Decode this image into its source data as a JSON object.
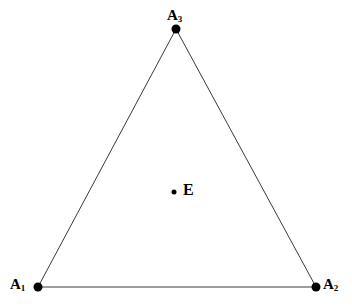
{
  "figure": {
    "background_color": "#ffffff",
    "width": 352,
    "height": 307,
    "stroke_color": "#3a3a3a",
    "marker_color": "#000000",
    "label_color": "#000000"
  },
  "labels": {
    "a1_base": "A",
    "a1_sub": "1",
    "a2_base": "A",
    "a2_sub": "2",
    "a3_base": "A",
    "a3_sub": "3",
    "e": "E"
  },
  "chart_data": {
    "type": "scatter",
    "title": "",
    "subtitle": "",
    "xlabel": "",
    "ylabel": "",
    "grid": false,
    "legend": null,
    "xlim": [
      0,
      352
    ],
    "ylim": [
      307,
      0
    ],
    "annotations": [
      {
        "name": "A3",
        "text": "A3",
        "x": 176,
        "y": 29,
        "position": "above"
      },
      {
        "name": "A1",
        "text": "A1",
        "x": 38,
        "y": 287,
        "position": "left"
      },
      {
        "name": "A2",
        "text": "A2",
        "x": 316,
        "y": 287,
        "position": "right"
      },
      {
        "name": "E",
        "text": "E",
        "x": 174,
        "y": 192,
        "position": "right"
      }
    ],
    "series": [
      {
        "name": "vertices",
        "marker": "filled-circle",
        "marker_size": 9,
        "points": [
          {
            "label": "A3",
            "x": 176,
            "y": 29
          },
          {
            "label": "A1",
            "x": 38,
            "y": 287
          },
          {
            "label": "A2",
            "x": 316,
            "y": 287
          }
        ]
      },
      {
        "name": "interior-point",
        "marker": "filled-circle",
        "marker_size": 5,
        "points": [
          {
            "label": "E",
            "x": 174,
            "y": 192
          }
        ]
      }
    ],
    "shapes": [
      {
        "name": "triangle",
        "type": "polygon",
        "closed": true,
        "fill": "none",
        "stroke": "#3a3a3a",
        "stroke_width": 1,
        "vertices": [
          {
            "label": "A3",
            "x": 176,
            "y": 29
          },
          {
            "label": "A2",
            "x": 316,
            "y": 287
          },
          {
            "label": "A1",
            "x": 38,
            "y": 287
          }
        ]
      }
    ]
  }
}
